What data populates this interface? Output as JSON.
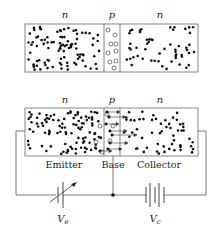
{
  "top_diagram": {
    "regions": [
      {
        "label": "n",
        "carrier": "electrons"
      },
      {
        "label": "p",
        "carrier": "holes"
      },
      {
        "label": "n",
        "carrier": "electrons"
      }
    ]
  },
  "bottom_diagram": {
    "regions": [
      {
        "label": "n",
        "name": "Emitter"
      },
      {
        "label": "p",
        "name": "Base"
      },
      {
        "label": "n",
        "name": "Collector"
      }
    ],
    "batteries": [
      {
        "label": "V",
        "subscript": "e",
        "type": "variable"
      },
      {
        "label": "V",
        "subscript": "c",
        "type": "fixed"
      }
    ]
  },
  "colors": {
    "line": "#555555",
    "dot": "#111111",
    "background": "#ffffff"
  }
}
